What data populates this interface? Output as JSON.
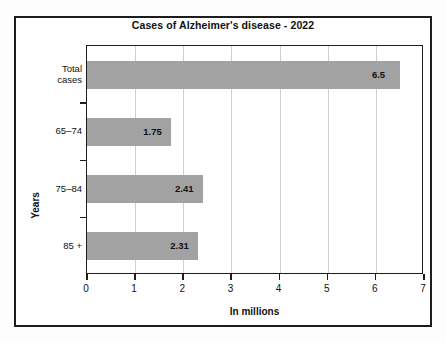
{
  "chart_data": {
    "type": "bar",
    "orientation": "horizontal",
    "title": "Cases of Alzheimer's disease - 2022",
    "categories": [
      "Total\ncases",
      "65–74",
      "75–84",
      "85 +"
    ],
    "values": [
      6.5,
      1.75,
      2.41,
      2.31
    ],
    "value_labels": [
      "6.5",
      "1.75",
      "2.41",
      "2.31"
    ],
    "xlabel": "In millions",
    "ylabel": "Years",
    "xlim": [
      0,
      7
    ],
    "xticks": [
      "0",
      "1",
      "2",
      "3",
      "4",
      "5",
      "6",
      "7"
    ],
    "grid": "vertical",
    "legend": "none",
    "bar_color": "#a2a2a2",
    "axis_color": "#1d1d1d",
    "gridline_color": "#cfcfcf",
    "background_color": "#ffffff"
  }
}
